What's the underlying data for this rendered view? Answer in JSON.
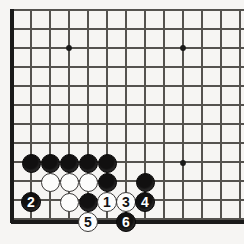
{
  "figure": {
    "kind": "go-board-diagram",
    "board": {
      "background_color": "#f6f5f3",
      "line_color": "#55534f",
      "edge_color": "#1a1a1a",
      "grid_spacing_px": 19,
      "origin_x_px": 12,
      "origin_y_px": 10,
      "columns_px": [
        12,
        31,
        50,
        69,
        88,
        107,
        126,
        145,
        164,
        183,
        202,
        221,
        240
      ],
      "rows_px": [
        10,
        29,
        48,
        67,
        86,
        105,
        124,
        143,
        162,
        181,
        200,
        219
      ],
      "left_edge_px": 12,
      "top_edge_px": 10,
      "bottom_edge_px": 222,
      "star_points": [
        {
          "name": "star-point-upper-left",
          "x": 69,
          "y": 48
        },
        {
          "name": "star-point-upper-right",
          "x": 183,
          "y": 48
        },
        {
          "name": "star-point-lower-right",
          "x": 183,
          "y": 163
        }
      ]
    },
    "stone_colors": {
      "black": "#111010",
      "white": "#fdfdfc",
      "black_label": "#ffffff",
      "white_label": "#131212"
    },
    "stones": [
      {
        "name": "stone-black-a",
        "color": "black",
        "label": "",
        "x": 31,
        "y": 163,
        "d": 19
      },
      {
        "name": "stone-black-b",
        "color": "black",
        "label": "",
        "x": 50,
        "y": 163,
        "d": 19
      },
      {
        "name": "stone-black-c",
        "color": "black",
        "label": "",
        "x": 69,
        "y": 163,
        "d": 19
      },
      {
        "name": "stone-black-d",
        "color": "black",
        "label": "",
        "x": 88,
        "y": 163,
        "d": 19
      },
      {
        "name": "stone-black-e",
        "color": "black",
        "label": "",
        "x": 107,
        "y": 163,
        "d": 19
      },
      {
        "name": "stone-white-f",
        "color": "white",
        "label": "",
        "x": 50,
        "y": 182,
        "d": 19
      },
      {
        "name": "stone-white-g",
        "color": "white",
        "label": "",
        "x": 69,
        "y": 182,
        "d": 19
      },
      {
        "name": "stone-white-h",
        "color": "white",
        "label": "",
        "x": 88,
        "y": 182,
        "d": 19
      },
      {
        "name": "stone-black-i",
        "color": "black",
        "label": "",
        "x": 107,
        "y": 182,
        "d": 19
      },
      {
        "name": "stone-black-j",
        "color": "black",
        "label": "",
        "x": 145,
        "y": 182,
        "d": 19
      },
      {
        "name": "stone-black-move-2",
        "color": "black",
        "label": "2",
        "x": 31,
        "y": 202,
        "d": 20
      },
      {
        "name": "stone-white-k",
        "color": "white",
        "label": "",
        "x": 69,
        "y": 202,
        "d": 19
      },
      {
        "name": "stone-black-l",
        "color": "black",
        "label": "",
        "x": 88,
        "y": 202,
        "d": 19
      },
      {
        "name": "stone-white-move-1",
        "color": "white",
        "label": "1",
        "x": 107,
        "y": 202,
        "d": 20
      },
      {
        "name": "stone-white-move-3",
        "color": "white",
        "label": "3",
        "x": 126,
        "y": 202,
        "d": 20
      },
      {
        "name": "stone-black-move-4",
        "color": "black",
        "label": "4",
        "x": 145,
        "y": 202,
        "d": 20
      },
      {
        "name": "stone-white-move-5",
        "color": "white",
        "label": "5",
        "x": 88,
        "y": 222,
        "d": 20
      },
      {
        "name": "stone-black-move-6",
        "color": "black",
        "label": "6",
        "x": 126,
        "y": 222,
        "d": 20
      }
    ],
    "move_sequence": [
      {
        "move": 1,
        "color": "white"
      },
      {
        "move": 2,
        "color": "black"
      },
      {
        "move": 3,
        "color": "white"
      },
      {
        "move": 4,
        "color": "black"
      },
      {
        "move": 5,
        "color": "white"
      },
      {
        "move": 6,
        "color": "black"
      }
    ]
  }
}
